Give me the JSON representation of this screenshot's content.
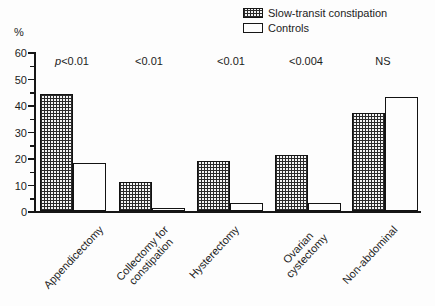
{
  "figure": {
    "background": "#fdfdfd",
    "ink": "#1c1c1c"
  },
  "chart_data": {
    "type": "bar",
    "title": "",
    "ylabel": "%",
    "xlabel": "",
    "ylim": [
      0,
      60
    ],
    "ytick_major_step": 10,
    "ytick_minor_step": 5,
    "grid": false,
    "legend_position": "top-right",
    "categories": [
      "Appendicectomy",
      "Collectomy for\nconstipation",
      "Hysterectomy",
      "Ovarian\ncystectomy",
      "Non-abdominal"
    ],
    "series": [
      {
        "name": "Slow-transit constipation",
        "fill": "crosshatch",
        "values": [
          44,
          11,
          19,
          21,
          37
        ]
      },
      {
        "name": "Controls",
        "fill": "white",
        "values": [
          18,
          0.5,
          3,
          3,
          43
        ]
      }
    ],
    "annotations": [
      "p<0.01",
      "<0.01",
      "<0.01",
      "<0.004",
      "NS"
    ]
  }
}
